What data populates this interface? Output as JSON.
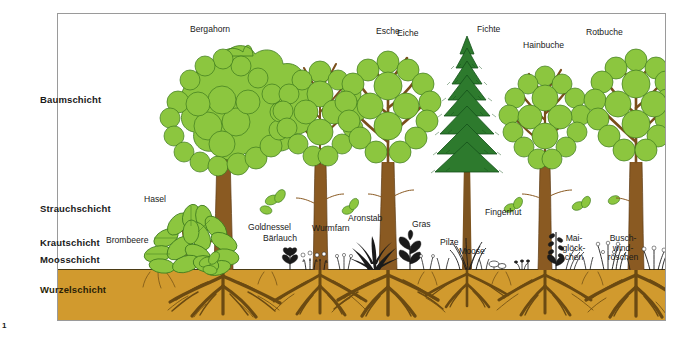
{
  "figure": {
    "number": "1",
    "soil_color": "#d19a2e",
    "crown_green": "#8cc63f",
    "conifer_green": "#2d7a2d",
    "trunk_brown": "#8a5a22",
    "root_brown": "#6b4a12"
  },
  "layers": [
    {
      "name": "tree-layer",
      "label": "Baumschicht",
      "x": 40,
      "y": 97
    },
    {
      "name": "shrub-layer",
      "label": "Strauchschicht",
      "x": 40,
      "y": 208
    },
    {
      "name": "herb-layer",
      "label": "Krautschicht",
      "x": 40,
      "y": 241
    },
    {
      "name": "moss-layer",
      "label": "Moosschicht",
      "x": 40,
      "y": 259
    },
    {
      "name": "root-layer",
      "label": "Wurzelschicht",
      "x": 40,
      "y": 288
    }
  ],
  "plants": [
    {
      "name": "bergahorn",
      "label": "Bergahorn",
      "x": 190,
      "y": 28,
      "w": 60
    },
    {
      "name": "esche",
      "label": "Esche",
      "x": 376,
      "y": 30,
      "w": 38
    },
    {
      "name": "eiche",
      "label": "Eiche",
      "x": 397,
      "y": 32,
      "w": 34
    },
    {
      "name": "fichte",
      "label": "Fichte",
      "x": 477,
      "y": 28,
      "w": 34
    },
    {
      "name": "hainbuche",
      "label": "Hainbuche",
      "x": 523,
      "y": 43,
      "w": 52
    },
    {
      "name": "rotbuche",
      "label": "Rotbuche",
      "x": 586,
      "y": 31,
      "w": 48
    },
    {
      "name": "hasel",
      "label": "Hasel",
      "x": 144,
      "y": 198,
      "w": 32
    },
    {
      "name": "brombeere",
      "label": "Brombeere",
      "x": 106,
      "y": 239,
      "w": 50
    },
    {
      "name": "goldnessel",
      "label": "Goldnessel",
      "x": 248,
      "y": 226,
      "w": 52
    },
    {
      "name": "baerlauch",
      "label": "Bärlauch",
      "x": 263,
      "y": 238,
      "w": 42
    },
    {
      "name": "wurmfarn",
      "label": "Wurmfarn",
      "x": 314,
      "y": 227,
      "w": 46
    },
    {
      "name": "aronstab",
      "label": "Aronstab",
      "x": 348,
      "y": 217,
      "w": 44
    },
    {
      "name": "gras",
      "label": "Gras",
      "x": 412,
      "y": 223,
      "w": 28
    },
    {
      "name": "pilze",
      "label": "Pilze",
      "x": 440,
      "y": 241,
      "w": 26
    },
    {
      "name": "fingerhut",
      "label": "Fingerhut",
      "x": 485,
      "y": 211,
      "w": 46
    },
    {
      "name": "moose",
      "label": "Moose",
      "x": 459,
      "y": 250,
      "w": 32
    },
    {
      "name": "maigloeckchen",
      "label": "Mai-\nglöck-\nchen",
      "x": 557,
      "y": 237,
      "w": 34
    },
    {
      "name": "buschwindroeschen",
      "label": "Busch-\nwind-\nröschen",
      "x": 600,
      "y": 237,
      "w": 44
    }
  ]
}
